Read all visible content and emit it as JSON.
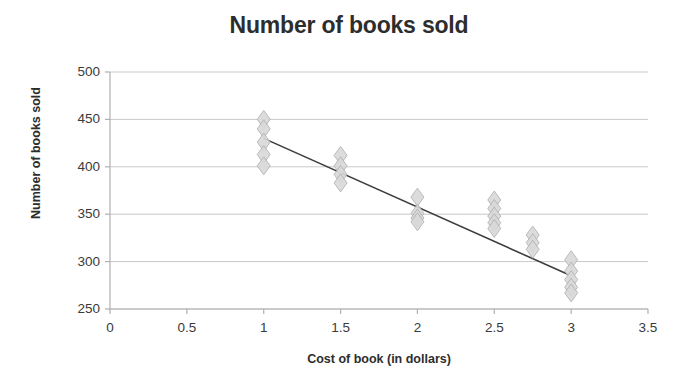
{
  "chart_data": {
    "type": "scatter",
    "title": "Number of books sold",
    "xlabel": "Cost of book (in dollars)",
    "ylabel": "Number of books sold",
    "xlim": [
      0,
      3.5
    ],
    "ylim": [
      250,
      500
    ],
    "xticks": [
      "0",
      "0.5",
      "1",
      "1.5",
      "2",
      "2.5",
      "3",
      "3.5"
    ],
    "xtick_values": [
      0,
      0.5,
      1,
      1.5,
      2,
      2.5,
      3,
      3.5
    ],
    "yticks": [
      "250",
      "300",
      "350",
      "400",
      "450",
      "500"
    ],
    "ytick_values": [
      250,
      300,
      350,
      400,
      450,
      500
    ],
    "grid": "horizontal",
    "legend": "none",
    "marker": "diamond",
    "marker_color": "#d9d9d9",
    "marker_edge_color": "#b3b3b3",
    "points": [
      {
        "x": 1,
        "y": 450
      },
      {
        "x": 1,
        "y": 440
      },
      {
        "x": 1,
        "y": 426
      },
      {
        "x": 1,
        "y": 413
      },
      {
        "x": 1,
        "y": 401
      },
      {
        "x": 1.5,
        "y": 412
      },
      {
        "x": 1.5,
        "y": 401
      },
      {
        "x": 1.5,
        "y": 392
      },
      {
        "x": 1.5,
        "y": 383
      },
      {
        "x": 2,
        "y": 368
      },
      {
        "x": 2,
        "y": 351
      },
      {
        "x": 2,
        "y": 346
      },
      {
        "x": 2,
        "y": 342
      },
      {
        "x": 2.5,
        "y": 365
      },
      {
        "x": 2.5,
        "y": 356
      },
      {
        "x": 2.5,
        "y": 348
      },
      {
        "x": 2.5,
        "y": 341
      },
      {
        "x": 2.5,
        "y": 335
      },
      {
        "x": 2.75,
        "y": 328
      },
      {
        "x": 2.75,
        "y": 320
      },
      {
        "x": 2.75,
        "y": 313
      },
      {
        "x": 3,
        "y": 302
      },
      {
        "x": 3,
        "y": 290
      },
      {
        "x": 3,
        "y": 281
      },
      {
        "x": 3,
        "y": 273
      },
      {
        "x": 3,
        "y": 267
      }
    ],
    "trendline": {
      "name": "linear trend",
      "color": "#3d3d3d",
      "x_start": 1,
      "y_start": 430,
      "x_end": 3,
      "y_end": 285
    }
  }
}
